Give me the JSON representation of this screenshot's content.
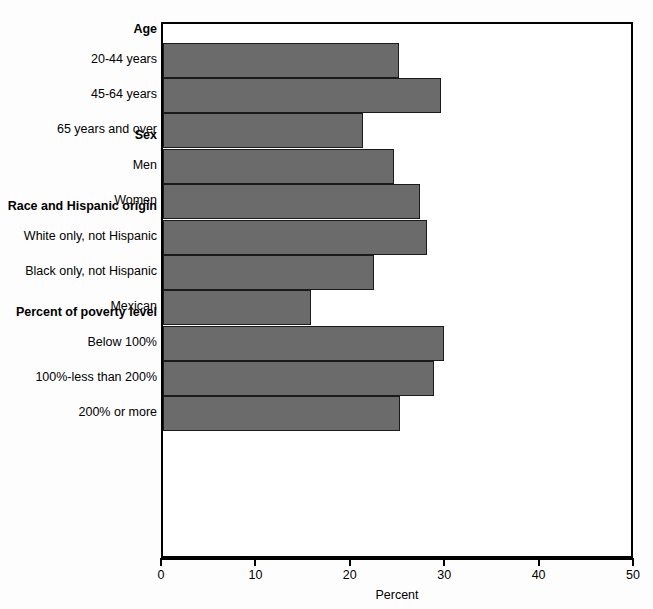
{
  "chart_data": {
    "type": "bar",
    "orientation": "horizontal",
    "title": "",
    "xlabel": "Percent",
    "ylabel": "",
    "xlim": [
      0,
      50
    ],
    "xticks": [
      0,
      10,
      20,
      30,
      40,
      50
    ],
    "xticklabels": [
      "0",
      "10",
      "20",
      "30",
      "40",
      "50"
    ],
    "grid": false,
    "legend": null,
    "bar_color": "#6b6b6b",
    "bar_edge_color": "#1a1a1a",
    "groups": [
      {
        "header": "Age",
        "categories": [
          "20-44 years",
          "45-64 years",
          "65 years and over"
        ],
        "values": [
          25.0,
          29.4,
          21.2
        ]
      },
      {
        "header": "Sex",
        "categories": [
          "Men",
          "Women"
        ],
        "values": [
          24.5,
          27.2
        ]
      },
      {
        "header": "Race and Hispanic origin",
        "categories": [
          "White only, not Hispanic",
          "Black only, not Hispanic",
          "Mexican"
        ],
        "values": [
          28.0,
          22.3,
          15.7
        ]
      },
      {
        "header": "Percent of poverty level",
        "categories": [
          "Below 100%",
          "100%-less than 200%",
          "200% or more"
        ],
        "values": [
          29.8,
          28.7,
          25.1
        ]
      }
    ]
  }
}
